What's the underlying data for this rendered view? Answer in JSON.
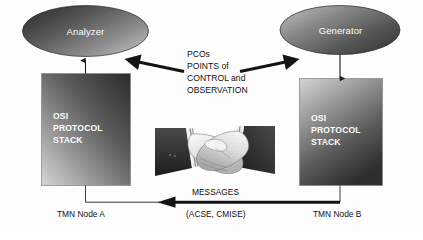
{
  "figure": {
    "background_color": "#ffffff",
    "ink_color": "#111111",
    "node_text_color": "#ffffff"
  },
  "nodes": {
    "analyzer": {
      "label": "Analyzer",
      "shape": "ellipse",
      "fill_dark": "#3a3a3a",
      "fill_light": "#b9b9b9"
    },
    "generator": {
      "label": "Generator",
      "shape": "ellipse",
      "fill_dark": "#3a3a3a",
      "fill_light": "#b9b9b9"
    }
  },
  "stacks": {
    "left": {
      "line1": "OSI",
      "line2": "PROTOCOL",
      "line3": "STACK",
      "fill_dark": "#2f2f2f",
      "fill_light": "#c9c9c9"
    },
    "right": {
      "line1": "OSI",
      "line2": "PROTOCOL",
      "line3": "STACK",
      "fill_dark": "#2f2f2f",
      "fill_light": "#c9c9c9"
    }
  },
  "pco": {
    "line1": "PCOs",
    "line2": "POINTS of",
    "line3": "CONTROL and",
    "line4": "OBSERVATION"
  },
  "messages": {
    "label": "MESSAGES",
    "protocols": "(ACSE, CMISE)"
  },
  "footers": {
    "left": "TMN Node A",
    "right": "TMN Node B"
  },
  "icons": {
    "handshake": "handshake-icon",
    "arrow_to_analyzer": "arrow-left-icon",
    "arrow_to_generator": "arrow-right-icon",
    "arrow_up_analyzer": "arrow-up-icon",
    "arrow_down_generator": "arrow-down-icon",
    "arrow_messages": "arrow-left-icon"
  }
}
